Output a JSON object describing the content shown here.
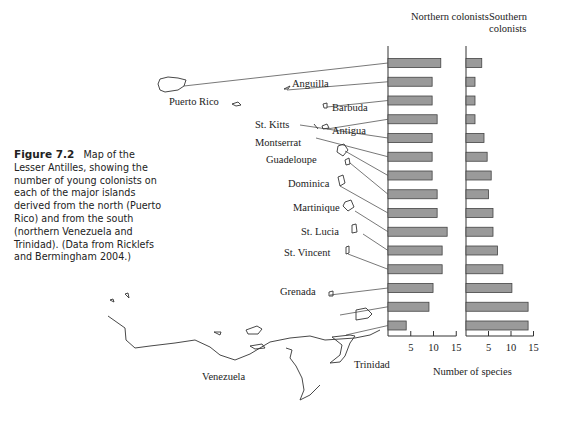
{
  "caption": {
    "figure": "Figure 7.2",
    "text": "Map of the Lesser Antilles, showing the number of young colonists on each of the major islands derived from the north (Puerto Rico) and from the south (northern Venezuela and Trinidad). (Data from Ricklefs and Bermingham 2004.)"
  },
  "map_labels": {
    "puerto_rico": "Puerto Rico",
    "anguilla": "Anguilla",
    "barbuda": "Barbuda",
    "st_kitts": "St. Kitts",
    "antigua": "Antigua",
    "montserrat": "Montserrat",
    "guadeloupe": "Guadeloupe",
    "dominica": "Dominica",
    "martinique": "Martinique",
    "st_lucia": "St. Lucia",
    "st_vincent": "St. Vincent",
    "grenada": "Grenada",
    "venezuela": "Venezuela",
    "trinidad": "Trinidad"
  },
  "chart_data": {
    "type": "bar",
    "orientation": "horizontal",
    "xlabel": "Number of species",
    "panels": [
      {
        "title": "Northern colonists",
        "ticks": [
          5,
          10,
          15
        ],
        "xlim": [
          0,
          15
        ]
      },
      {
        "title": "Southern colonists",
        "ticks": [
          5,
          10,
          15
        ],
        "xlim": [
          0,
          15
        ]
      }
    ],
    "categories": [
      "Island 1 (Puerto Rico line)",
      "Island 2",
      "Island 3",
      "Island 4",
      "Island 5",
      "Island 6",
      "Island 7",
      "Island 8",
      "Island 9",
      "Island 10",
      "Island 11",
      "Island 12",
      "Island 13",
      "Island 14",
      "Island 15 (Trinidad line)"
    ],
    "series": [
      {
        "name": "Northern colonists",
        "values": [
          11.6,
          9.7,
          9.7,
          10.8,
          9.7,
          9.7,
          9.7,
          10.8,
          10.8,
          13,
          11.9,
          11.9,
          9.9,
          9,
          4
        ]
      },
      {
        "name": "Southern colonists",
        "values": [
          3.5,
          2,
          2,
          2,
          4,
          4.7,
          5.6,
          5,
          6,
          6,
          7,
          8.2,
          10.2,
          13.8,
          13.8
        ]
      }
    ],
    "grid": false
  }
}
